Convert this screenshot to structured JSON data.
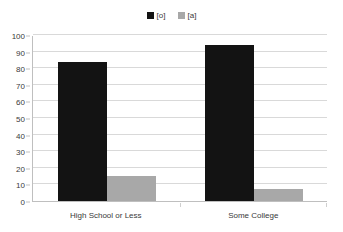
{
  "chart_data": {
    "type": "bar",
    "title": "",
    "subtitle": "",
    "xlabel": "",
    "ylabel": "",
    "categories": [
      "High School or Less",
      "Some College"
    ],
    "series": [
      {
        "name": "[o]",
        "color": "#131313",
        "values": [
          84,
          94
        ]
      },
      {
        "name": "[a]",
        "color": "#a8a8a8",
        "values": [
          15,
          7
        ]
      }
    ],
    "ylim": [
      0,
      100
    ],
    "yticks": [
      100,
      90,
      80,
      70,
      60,
      50,
      40,
      30,
      20,
      10,
      0
    ],
    "grid": true,
    "legend_position": "top-center",
    "annotations": []
  },
  "legend": {
    "entries": [
      {
        "label": "[o]",
        "color": "#131313"
      },
      {
        "label": "[a]",
        "color": "#a8a8a8"
      }
    ]
  },
  "axes": {
    "y_tick_labels": [
      "100",
      "90",
      "80",
      "70",
      "60",
      "50",
      "40",
      "30",
      "20",
      "10",
      "0"
    ],
    "x_tick_labels": [
      "High School or Less",
      "Some College"
    ]
  },
  "colors": {
    "series_dark": "#131313",
    "series_grey": "#a8a8a8",
    "gridline": "#d9d9d9",
    "axis": "#bfbfbf",
    "text": "#3a3a3a",
    "background": "#ffffff"
  }
}
